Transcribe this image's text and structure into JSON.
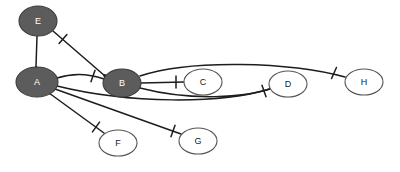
{
  "diagram": {
    "background_color": "#ffffff",
    "edge_color": "#1d1d1d",
    "filled_node_color": "#5c5c5c",
    "hollow_node_color": "#ffffff",
    "node_stroke_color": "#3a3a3a"
  },
  "nodes": [
    {
      "id": "E",
      "label": "E",
      "cx": 38,
      "cy": 21,
      "rx": 19,
      "ry": 15,
      "style": "filled"
    },
    {
      "id": "A",
      "label": "A",
      "cx": 37,
      "cy": 82,
      "rx": 21,
      "ry": 15,
      "style": "filled"
    },
    {
      "id": "B",
      "label": "B",
      "cx": 122,
      "cy": 83,
      "rx": 19,
      "ry": 14,
      "style": "filled"
    },
    {
      "id": "C",
      "label": "C",
      "cx": 203,
      "cy": 82,
      "rx": 19,
      "ry": 13,
      "style": "hollow"
    },
    {
      "id": "D",
      "label": "D",
      "cx": 288,
      "cy": 84,
      "rx": 19,
      "ry": 13,
      "style": "hollow"
    },
    {
      "id": "H",
      "label": "H",
      "cx": 364,
      "cy": 82,
      "rx": 19,
      "ry": 13,
      "style": "hollow"
    },
    {
      "id": "F",
      "label": "F",
      "cx": 118,
      "cy": 143,
      "rx": 19,
      "ry": 13,
      "style": "hollow"
    },
    {
      "id": "G",
      "label": "G",
      "cx": 198,
      "cy": 141,
      "rx": 19,
      "ry": 13,
      "style": "hollow"
    }
  ],
  "edges": [
    {
      "id": "E-A",
      "from": "E",
      "to": "A",
      "path": "M 37 36 L 36 67",
      "marks": [
        {
          "type": "crowsfoot",
          "x": 36,
          "y": 67,
          "angle": 90
        }
      ]
    },
    {
      "id": "E-B",
      "from": "E",
      "to": "B",
      "path": "M 53 31 L 105 76",
      "marks": [
        {
          "type": "one",
          "x": 63,
          "y": 39,
          "angle": 41
        },
        {
          "type": "crowsfoot",
          "x": 104,
          "y": 75,
          "angle": 41
        }
      ]
    },
    {
      "id": "A-B",
      "from": "A",
      "to": "B",
      "path": "M 57 78 C 75 72, 90 74, 104 79",
      "marks": [
        {
          "type": "one",
          "x": 93,
          "y": 76,
          "angle": 20
        }
      ]
    },
    {
      "id": "B-C",
      "from": "B",
      "to": "C",
      "path": "M 141 83 L 184 82",
      "marks": [
        {
          "type": "one",
          "x": 176,
          "y": 82,
          "angle": 0
        }
      ]
    },
    {
      "id": "B-H",
      "from": "B",
      "to": "H",
      "path": "M 140 76 C 190 59, 290 62, 345 77",
      "marks": [
        {
          "type": "one",
          "x": 334,
          "y": 73,
          "angle": 24
        }
      ]
    },
    {
      "id": "B-D",
      "from": "B",
      "to": "D",
      "path": "M 140 88 C 190 101, 245 98, 272 88",
      "marks": [
        {
          "type": "one",
          "x": 264,
          "y": 91,
          "angle": -20
        }
      ]
    },
    {
      "id": "A-F",
      "from": "A",
      "to": "F",
      "path": "M 49 93 L 104 133",
      "marks": [
        {
          "type": "one",
          "x": 96,
          "y": 127,
          "angle": 36
        }
      ]
    },
    {
      "id": "A-G",
      "from": "A",
      "to": "G",
      "path": "M 55 89 L 181 134",
      "marks": [
        {
          "type": "one",
          "x": 173,
          "y": 131,
          "angle": 20
        }
      ]
    },
    {
      "id": "A-D",
      "from": "A",
      "to": "D",
      "path": "M 57 86 C 130 104, 220 104, 270 89",
      "marks": []
    }
  ]
}
